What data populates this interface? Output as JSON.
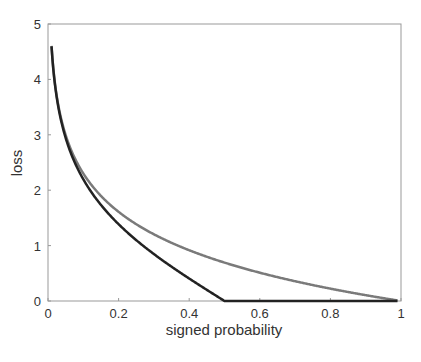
{
  "chart_data": {
    "type": "line",
    "title": "",
    "xlabel": "signed probability",
    "ylabel": "loss",
    "xlim": [
      0,
      1
    ],
    "ylim": [
      0,
      5
    ],
    "xticks": [
      "0",
      "0.2",
      "0.4",
      "0.6",
      "0.8",
      "1"
    ],
    "yticks": [
      "0",
      "1",
      "2",
      "3",
      "4",
      "5"
    ],
    "grid": false,
    "legend": null,
    "x": [
      0.01,
      0.05,
      0.1,
      0.2,
      0.3,
      0.4,
      0.5,
      0.6,
      0.7,
      0.8,
      0.9,
      0.99
    ],
    "series": [
      {
        "name": "grey curve (-log p)",
        "color": "#7a7a7a",
        "values": [
          4.61,
          3.0,
          2.3,
          1.61,
          1.2,
          0.92,
          0.69,
          0.51,
          0.36,
          0.22,
          0.11,
          0.01
        ]
      },
      {
        "name": "dark curve",
        "color": "#222222",
        "values": [
          4.6,
          2.94,
          2.2,
          1.39,
          0.85,
          0.41,
          0.0,
          0.0,
          0.0,
          0.0,
          0.0,
          0.0
        ]
      }
    ]
  }
}
